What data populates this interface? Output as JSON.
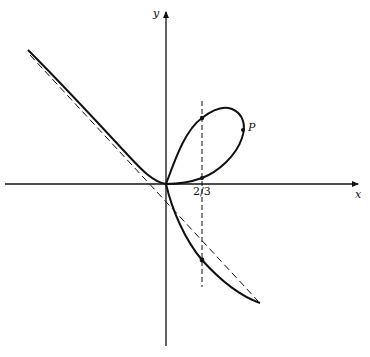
{
  "figure": {
    "type": "curve-plot",
    "axes": {
      "x_label": "x",
      "y_label": "y"
    },
    "annotations": {
      "tick_label": "2/3",
      "point_label": "P"
    },
    "elements": [
      {
        "name": "curve",
        "style": "solid",
        "description": "Curve with a loop in the first quadrant passing through the origin, and two branches approaching the oblique asymptote"
      },
      {
        "name": "asymptote",
        "style": "dashed",
        "description": "Oblique dashed asymptote line with negative slope"
      },
      {
        "name": "vertical-line",
        "style": "dashed",
        "description": "Vertical dashed line at x = 2/3"
      }
    ],
    "colors": {
      "stroke": "#111111",
      "background": "#ffffff"
    }
  }
}
